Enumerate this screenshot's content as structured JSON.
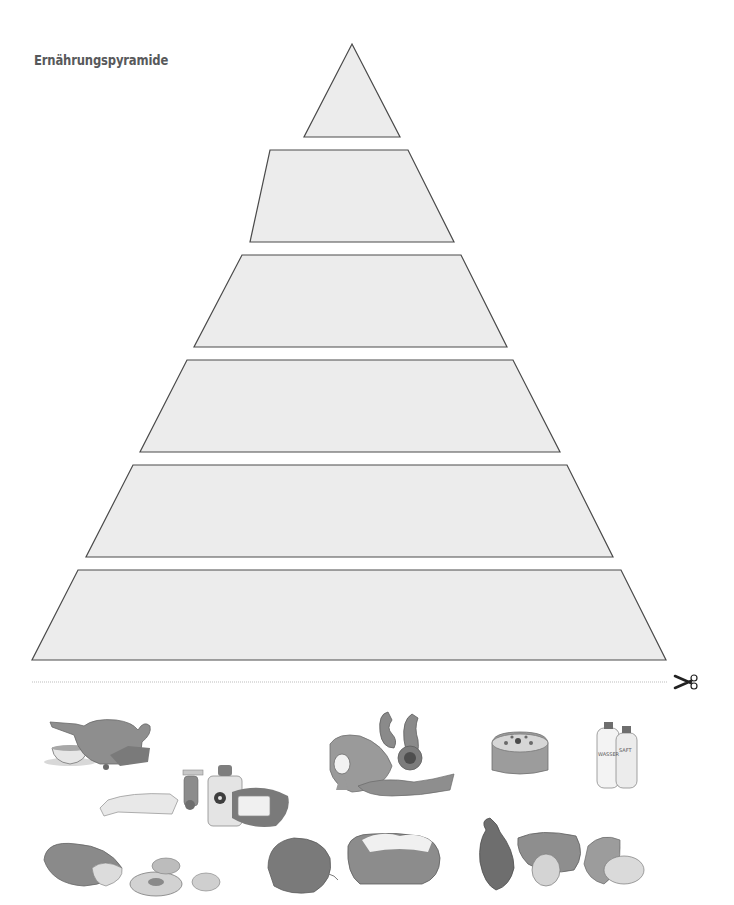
{
  "title": "Ernährungspyramide",
  "pyramid": {
    "fill_color": "#ececec",
    "stroke_color": "#4a4a4a",
    "tiers": [
      {
        "level": 1,
        "shape": "triangle",
        "points": "352,44 400,137 304,137"
      },
      {
        "level": 2,
        "shape": "trapezoid",
        "points": "270,150 408,150 454,242 250,242"
      },
      {
        "level": 3,
        "shape": "trapezoid",
        "points": "242,255 461,255 507,347 194,347"
      },
      {
        "level": 4,
        "shape": "trapezoid",
        "points": "187,360 513,360 560,452 140,452"
      },
      {
        "level": 5,
        "shape": "trapezoid",
        "points": "133,465 567,465 613,557 86,557"
      },
      {
        "level": 6,
        "shape": "trapezoid",
        "points": "78,570 621,570 666,660 32,660"
      }
    ]
  },
  "cut_line": {
    "icon": "scissors-icon",
    "color": "#b8b8b8"
  },
  "cutouts": [
    {
      "name": "tea-and-teapot",
      "label": "Tee"
    },
    {
      "name": "fats-oils-butter",
      "label": "Fette und Öle"
    },
    {
      "name": "meat-sausage-fish-egg",
      "label": "Fleisch, Wurst, Fisch"
    },
    {
      "name": "cake-sweets",
      "label": "Kuchen"
    },
    {
      "name": "water-bottles",
      "label": "Getränke",
      "bottle_labels": [
        "WASSER",
        "SAFT"
      ]
    },
    {
      "name": "bread-pretzels",
      "label": "Brot und Getreide"
    },
    {
      "name": "vegetables",
      "label": "Gemüse"
    },
    {
      "name": "fruits",
      "label": "Obst"
    }
  ]
}
